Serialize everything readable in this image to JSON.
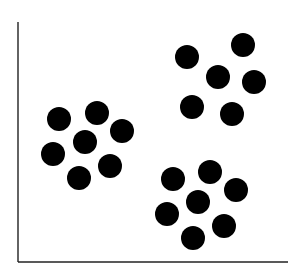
{
  "chart_data": {
    "type": "scatter",
    "title": "",
    "xlabel": "",
    "ylabel": "",
    "grid": false,
    "legend": null,
    "axis_style": {
      "color": "#222222",
      "ticks": false,
      "tick_labels": false
    },
    "marker": {
      "shape": "circle",
      "color": "#000000",
      "radius_px": 12
    },
    "series": [
      {
        "name": "cluster-left",
        "points_px": [
          [
            59,
            119
          ],
          [
            97,
            113
          ],
          [
            122,
            131
          ],
          [
            85,
            142
          ],
          [
            53,
            154
          ],
          [
            110,
            166
          ],
          [
            79,
            178
          ]
        ]
      },
      {
        "name": "cluster-top-right",
        "points_px": [
          [
            187,
            57
          ],
          [
            243,
            45
          ],
          [
            218,
            77
          ],
          [
            254,
            82
          ],
          [
            192,
            107
          ],
          [
            232,
            114
          ]
        ]
      },
      {
        "name": "cluster-bottom-right",
        "points_px": [
          [
            173,
            179
          ],
          [
            210,
            172
          ],
          [
            236,
            190
          ],
          [
            198,
            202
          ],
          [
            167,
            214
          ],
          [
            224,
            226
          ],
          [
            193,
            238
          ]
        ]
      }
    ],
    "axes_px": {
      "origin": [
        18,
        262
      ],
      "x_end": 288,
      "y_top": 22
    }
  }
}
